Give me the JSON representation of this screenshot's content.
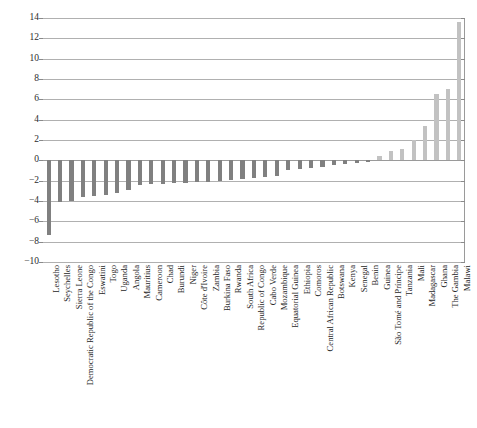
{
  "chart_data": {
    "type": "bar",
    "title": "",
    "subtitle": "",
    "xlabel": "",
    "ylabel": "",
    "ylim": [
      -10,
      14
    ],
    "yticks": [
      -10,
      -8,
      -6,
      -4,
      -2,
      0,
      2,
      4,
      6,
      8,
      10,
      12,
      14
    ],
    "ytick_labels": [
      "−10",
      "−8",
      "−6",
      "−4",
      "−2",
      "0",
      "2",
      "4",
      "6",
      "8",
      "10",
      "12",
      "14"
    ],
    "grid": true,
    "legend": "none",
    "categories": [
      "Lesotho",
      "Seychelles",
      "Sierra Leone",
      "Democratic Republic of the Congo",
      "Eswatini",
      "Togo",
      "Uganda",
      "Angola",
      "Mauritius",
      "Cameroon",
      "Chad",
      "Burundi",
      "Niger",
      "Côte d'Ivoire",
      "Zambia",
      "Burkina Faso",
      "Rwanda",
      "South Africa",
      "Republic of Congo",
      "Cabo Verde",
      "Mozambique",
      "Equatorial Guinea",
      "Ethiopia",
      "Comoros",
      "Central African Republic",
      "Botswana",
      "Kenya",
      "Senegal",
      "Benin",
      "Guinea",
      "São Tomé and Príncipe",
      "Tanzania",
      "Mali",
      "Madagascar",
      "Ghana",
      "The Gambia",
      "Malawi"
    ],
    "values": [
      -7.3,
      -4.1,
      -4.0,
      -3.6,
      -3.5,
      -3.4,
      -3.2,
      -2.9,
      -2.4,
      -2.3,
      -2.3,
      -2.2,
      -2.2,
      -2.1,
      -2.1,
      -2.0,
      -1.9,
      -1.8,
      -1.7,
      -1.6,
      -1.5,
      -1.0,
      -0.9,
      -0.8,
      -0.7,
      -0.5,
      -0.4,
      -0.3,
      -0.2,
      0.4,
      0.9,
      1.1,
      2.0,
      3.4,
      6.5,
      7.0,
      13.6
    ],
    "colors": {
      "negative_bar": "#808080",
      "positive_bar": "#c2c2c2",
      "gridline": "#b0b0b0",
      "axis": "#9a9a9a",
      "text": "#262626",
      "background": "#ffffff"
    }
  },
  "caption": {
    "text": ""
  }
}
